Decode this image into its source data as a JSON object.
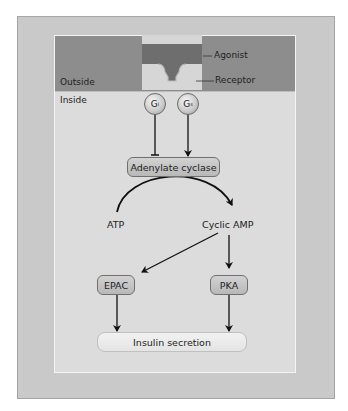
{
  "diagram": {
    "regions": {
      "outside_label": "Outside",
      "inside_label": "Inside"
    },
    "membrane": {
      "agonist_label": "Agonist",
      "receptor_label": "Receptor"
    },
    "g_proteins": [
      {
        "letter": "G",
        "subscript": "i",
        "effect": "inhibits"
      },
      {
        "letter": "G",
        "subscript": "s",
        "effect": "stimulates"
      }
    ],
    "nodes": {
      "adenylate_cyclase": "Adenylate cyclase",
      "atp": "ATP",
      "cyclic_amp": "Cyclic AMP",
      "epac": "EPAC",
      "pka": "PKA",
      "insulin_secretion": "Insulin secretion"
    },
    "edges": [
      {
        "from": "Gi",
        "to": "Adenylate cyclase",
        "type": "inhibition"
      },
      {
        "from": "Gs",
        "to": "Adenylate cyclase",
        "type": "activation"
      },
      {
        "from": "ATP",
        "to": "Cyclic AMP",
        "type": "conversion",
        "via": "Adenylate cyclase"
      },
      {
        "from": "Cyclic AMP",
        "to": "EPAC",
        "type": "activation"
      },
      {
        "from": "Cyclic AMP",
        "to": "PKA",
        "type": "activation"
      },
      {
        "from": "EPAC",
        "to": "Insulin secretion",
        "type": "activation"
      },
      {
        "from": "PKA",
        "to": "Insulin secretion",
        "type": "activation"
      }
    ],
    "colors": {
      "outer_frame": "#c9c9c9",
      "inner_panel": "#dcdcdc",
      "outside_band": "#8d8d8d",
      "agonist": "#6e6e6e",
      "receptor": "#d6d6d6",
      "node_fill": "#c4c4c4",
      "result_fill": "#eeeeee",
      "line": "#111111"
    }
  }
}
